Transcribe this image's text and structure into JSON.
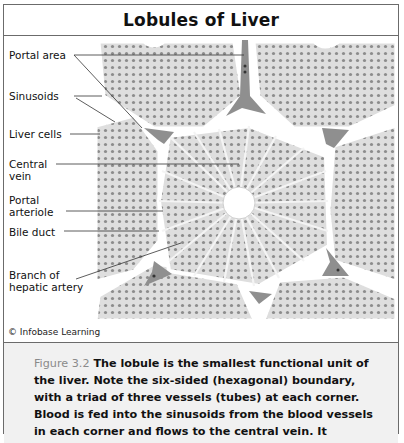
{
  "figure": {
    "title": "Lobules of Liver",
    "labels": {
      "portal_area": "Portal area",
      "sinusoids": "Sinusoids",
      "liver_cells": "Liver cells",
      "central_vein_1": "Central",
      "central_vein_2": "vein",
      "portal_arteriole_1": "Portal",
      "portal_arteriole_2": "arteriole",
      "bile_duct": "Bile duct",
      "hepatic_artery_1": "Branch of",
      "hepatic_artery_2": "hepatic artery"
    },
    "credit": "© Infobase Learning",
    "caption": {
      "number": "Figure 3.2",
      "text": " The lobule is the smallest functional unit of the liver. Note the six-sided (hexagonal) boundary, with a triad of three vessels (tubes) at each corner. Blood is fed into the sinusoids from the blood vessels in each corner and flows to the central vein. It"
    },
    "colors": {
      "border": "#6b6b6b",
      "lobule_fill": "#d9d9d9",
      "cell_dot": "#8c8c8c",
      "portal_triad": "#8f8f8f",
      "caption_bg": "#f1f1f1",
      "figure_number": "#8a8a8a"
    }
  }
}
